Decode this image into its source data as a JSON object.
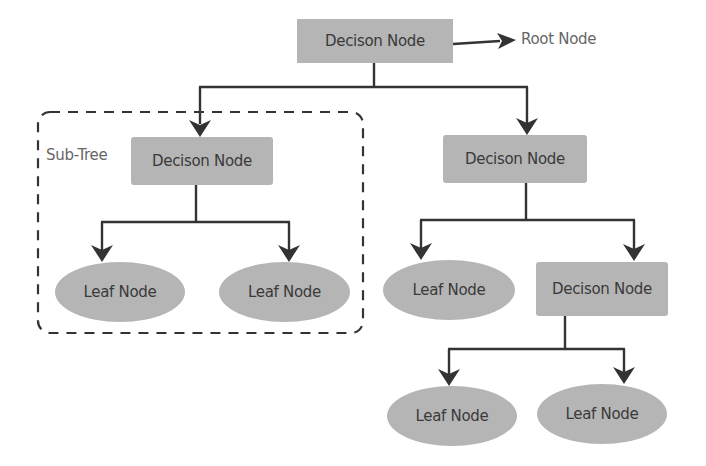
{
  "diagram": {
    "type": "decision-tree",
    "colors": {
      "node_fill": "#b5b5b5",
      "node_text": "#3a3a3a",
      "line": "#333333",
      "annotation_text": "#666666"
    },
    "annotations": {
      "root_label": "Root Node",
      "subtree_label": "Sub-Tree"
    },
    "nodes": {
      "root": {
        "label": "Decison Node",
        "kind": "decision"
      },
      "left_decision": {
        "label": "Decison Node",
        "kind": "decision"
      },
      "left_leaf_1": {
        "label": "Leaf Node",
        "kind": "leaf"
      },
      "left_leaf_2": {
        "label": "Leaf Node",
        "kind": "leaf"
      },
      "right_decision": {
        "label": "Decison Node",
        "kind": "decision"
      },
      "right_leaf": {
        "label": "Leaf Node",
        "kind": "leaf"
      },
      "right_sub_decision": {
        "label": "Decison Node",
        "kind": "decision"
      },
      "bottom_leaf_1": {
        "label": "Leaf Node",
        "kind": "leaf"
      },
      "bottom_leaf_2": {
        "label": "Leaf Node",
        "kind": "leaf"
      }
    },
    "edges": [
      [
        "root",
        "left_decision"
      ],
      [
        "root",
        "right_decision"
      ],
      [
        "left_decision",
        "left_leaf_1"
      ],
      [
        "left_decision",
        "left_leaf_2"
      ],
      [
        "right_decision",
        "right_leaf"
      ],
      [
        "right_decision",
        "right_sub_decision"
      ],
      [
        "right_sub_decision",
        "bottom_leaf_1"
      ],
      [
        "right_sub_decision",
        "bottom_leaf_2"
      ]
    ]
  }
}
